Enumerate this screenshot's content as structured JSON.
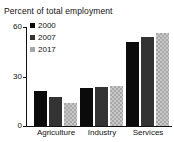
{
  "chart_data": {
    "type": "bar",
    "title": "Percent of total employment",
    "xlabel": "",
    "ylabel": "",
    "ylim": [
      0,
      60
    ],
    "yticks": [
      0,
      30,
      60
    ],
    "ytick_labels": [
      "0",
      "30",
      "60"
    ],
    "grid": false,
    "legend_position": "top-left",
    "categories": [
      "Agriculture",
      "Industry",
      "Services"
    ],
    "series": [
      {
        "name": "2000",
        "color": "#0b0b0b",
        "values": [
          21,
          23,
          51
        ]
      },
      {
        "name": "2007",
        "color": "#333333",
        "values": [
          17.5,
          23.5,
          54
        ]
      },
      {
        "name": "2017",
        "color": "#a8a8a8",
        "values": [
          14,
          24.5,
          56.5
        ]
      }
    ]
  }
}
